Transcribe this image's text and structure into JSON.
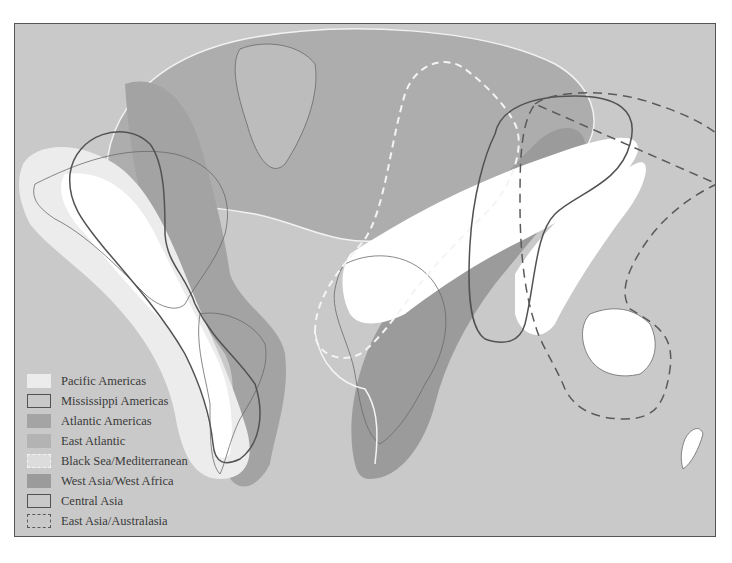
{
  "map": {
    "title": "",
    "colors": {
      "ocean": "#c8c8c8",
      "land": "#bdbdbd",
      "coast": "#6a6a6a",
      "pacific_americas": "#ececec",
      "atlantic_americas": "#a4a4a4",
      "east_atlantic": "#b2b2b2",
      "west_asia_west_africa": "#9a9a9a",
      "outline_dark": "#505050",
      "outline_light": "#f4f4f4",
      "highlight_white": "#ffffff"
    }
  },
  "legend": {
    "items": [
      {
        "label": "Pacific Americas",
        "style": "fill-light"
      },
      {
        "label": "Mississippi Americas",
        "style": "solid-outline"
      },
      {
        "label": "Atlantic Americas",
        "style": "fill-medium"
      },
      {
        "label": "East Atlantic",
        "style": "fill-light-medium"
      },
      {
        "label": "Black Sea/Mediterranean",
        "style": "dashed-white-outline"
      },
      {
        "label": "West Asia/West Africa",
        "style": "fill-dark"
      },
      {
        "label": "Central Asia",
        "style": "solid-outline"
      },
      {
        "label": "East Asia/Australasia",
        "style": "dashed-dark-outline"
      }
    ]
  }
}
